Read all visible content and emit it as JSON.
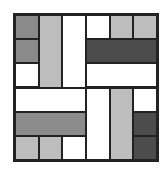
{
  "diagram": {
    "type": "tiling-puzzle",
    "grid": {
      "cols": 6,
      "rows": 6
    },
    "colors": {
      "white": "#ffffff",
      "light": "#bdbdbd",
      "medium": "#8c8c8c",
      "dark": "#8a8a8a",
      "very_dark": "#4c4c4c",
      "border": "#222222"
    },
    "tiles": [
      {
        "col": 0,
        "row": 0,
        "w": 1,
        "h": 1,
        "fill": "dark"
      },
      {
        "col": 0,
        "row": 1,
        "w": 1,
        "h": 1,
        "fill": "dark"
      },
      {
        "col": 0,
        "row": 2,
        "w": 1,
        "h": 1,
        "fill": "white"
      },
      {
        "col": 1,
        "row": 0,
        "w": 1,
        "h": 3,
        "fill": "light"
      },
      {
        "col": 2,
        "row": 0,
        "w": 1,
        "h": 3,
        "fill": "white"
      },
      {
        "col": 3,
        "row": 0,
        "w": 1,
        "h": 1,
        "fill": "white"
      },
      {
        "col": 4,
        "row": 0,
        "w": 1,
        "h": 1,
        "fill": "light"
      },
      {
        "col": 5,
        "row": 0,
        "w": 1,
        "h": 1,
        "fill": "light"
      },
      {
        "col": 3,
        "row": 1,
        "w": 3,
        "h": 1,
        "fill": "very_dark"
      },
      {
        "col": 3,
        "row": 2,
        "w": 3,
        "h": 1,
        "fill": "white"
      },
      {
        "col": 0,
        "row": 3,
        "w": 3,
        "h": 1,
        "fill": "white"
      },
      {
        "col": 0,
        "row": 4,
        "w": 3,
        "h": 1,
        "fill": "medium"
      },
      {
        "col": 0,
        "row": 5,
        "w": 1,
        "h": 1,
        "fill": "light"
      },
      {
        "col": 1,
        "row": 5,
        "w": 1,
        "h": 1,
        "fill": "light"
      },
      {
        "col": 2,
        "row": 5,
        "w": 1,
        "h": 1,
        "fill": "white"
      },
      {
        "col": 3,
        "row": 3,
        "w": 1,
        "h": 3,
        "fill": "white"
      },
      {
        "col": 4,
        "row": 3,
        "w": 1,
        "h": 3,
        "fill": "light"
      },
      {
        "col": 5,
        "row": 3,
        "w": 1,
        "h": 1,
        "fill": "white"
      },
      {
        "col": 5,
        "row": 4,
        "w": 1,
        "h": 1,
        "fill": "very_dark"
      },
      {
        "col": 5,
        "row": 5,
        "w": 1,
        "h": 1,
        "fill": "very_dark"
      }
    ]
  }
}
